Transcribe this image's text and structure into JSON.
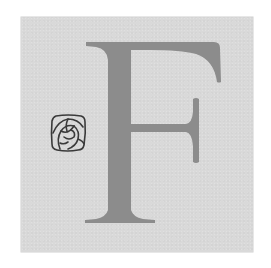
{
  "initial": {
    "letter": "F",
    "ornament": "rose-icon"
  },
  "colors": {
    "tile_background": "#d9d9d9",
    "letter_fill": "#8c8c8c",
    "ornament_stroke": "#3a3a3a",
    "page_background": "#ffffff"
  }
}
